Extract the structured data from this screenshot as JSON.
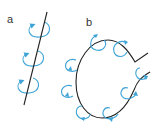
{
  "figure": {
    "panels": [
      {
        "label": "a",
        "description": "straight line with circulating arrows"
      },
      {
        "label": "b",
        "description": "curved loop line with circulating arrows"
      }
    ],
    "colors": {
      "line": "#222222",
      "arrow": "#3ea3d6"
    }
  }
}
